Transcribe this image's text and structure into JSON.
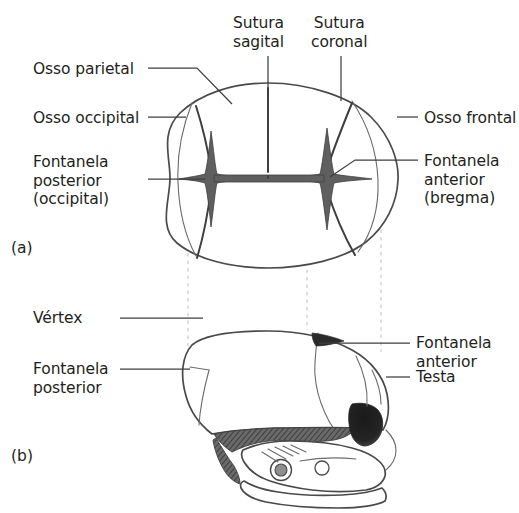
{
  "figure": {
    "language": "pt",
    "colors": {
      "background": "#ffffff",
      "outline": "#4a4a4a",
      "suture": "#3f3f3f",
      "fontanelle_fill": "#5f5f5f",
      "orbit_fill": "#2b2b2b",
      "leader": "#3f3f3f",
      "dashed_guide": "#c3c3c3",
      "text": "#231f20"
    }
  },
  "panels": [
    {
      "id": "a",
      "id_label": "(a)",
      "view": "superior",
      "labels": {
        "osso_parietal": "Osso parietal",
        "osso_occipital": "Osso occipital",
        "fontanela_posterior": "Fontanela\nposterior\n(occipital)",
        "sutura_sagital": "Sutura\nsagital",
        "sutura_coronal": "Sutura\ncoronal",
        "osso_frontal": "Osso frontal",
        "fontanela_anterior": "Fontanela\nanterior\n(bregma)"
      }
    },
    {
      "id": "b",
      "id_label": "(b)",
      "view": "lateral",
      "labels": {
        "vertex": "Vértex",
        "fontanela_posterior": "Fontanela\nposterior",
        "fontanela_anterior": "Fontanela\nanterior",
        "testa": "Testa"
      }
    }
  ],
  "caption_partial": ""
}
